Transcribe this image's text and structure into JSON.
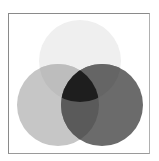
{
  "diagram": {
    "type": "venn",
    "sets": [
      {
        "id": "top",
        "cx": 80,
        "cy": 61,
        "r": 41,
        "color": "#efefef"
      },
      {
        "id": "left",
        "cx": 58,
        "cy": 105,
        "r": 41,
        "color": "#c6c6c6"
      },
      {
        "id": "right",
        "cx": 102,
        "cy": 105,
        "r": 41,
        "color": "#6b6b6b"
      }
    ],
    "regions": {
      "top_left": "#bdbdbd",
      "top_right": "#656565",
      "left_right": "#5a5a5a",
      "all": "#1e1e1e"
    },
    "frame_color": "#8a8a8a"
  }
}
